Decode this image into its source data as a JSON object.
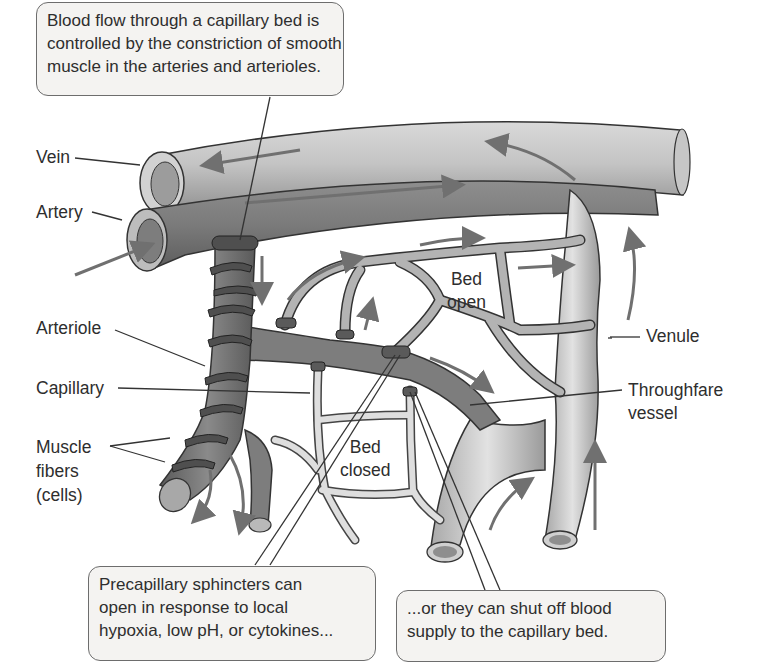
{
  "diagram": {
    "colors": {
      "background": "#ffffff",
      "callout_fill": "#f4f3f1",
      "callout_border": "#6d6d6d",
      "vein": "#bdbdbd",
      "artery": "#8a8a8a",
      "arteriole": "#6f6f6f",
      "muscle_fiber": "#4f4f4f",
      "capillary": "#c8c8c8",
      "arrow": "#707070",
      "text": "#2e2e2e"
    },
    "callouts": {
      "top": {
        "lines": [
          "Blood flow through a capillary bed is",
          "controlled by the constriction of smooth",
          "muscle in the arteries and arterioles."
        ]
      },
      "bottom_left": {
        "lines": [
          "Precapillary sphincters can",
          "open in response to local",
          "hypoxia, low pH, or cytokines..."
        ]
      },
      "bottom_right": {
        "lines": [
          "...or they can shut off blood",
          "supply to the capillary bed."
        ]
      }
    },
    "labels": {
      "vein": "Vein",
      "artery": "Artery",
      "arteriole": "Arteriole",
      "capillary": "Capillary",
      "muscle_fibers": [
        "Muscle",
        "fibers",
        "(cells)"
      ],
      "venule": "Venule",
      "throughfare_vessel": [
        "Throughfare",
        "vessel"
      ],
      "bed_open": [
        "Bed",
        "open"
      ],
      "bed_closed": [
        "Bed",
        "closed"
      ]
    }
  }
}
